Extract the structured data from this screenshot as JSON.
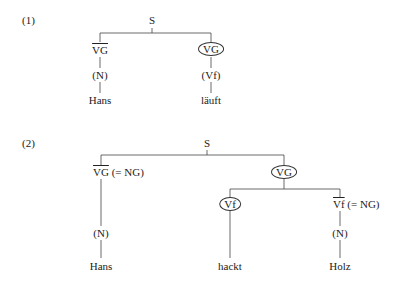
{
  "examples": [
    {
      "number": "(1)",
      "root": "S",
      "left_branch": {
        "node_bar": "VG",
        "node_rest": "",
        "child": "(N)",
        "leaf": "Hans"
      },
      "right_branch": {
        "node": "VG",
        "circled": true,
        "child": "(Vf)",
        "leaf": "läuft"
      }
    },
    {
      "number": "(2)",
      "root": "S",
      "left_branch": {
        "node_bar": "VG",
        "node_rest": " (= NG)",
        "child": "(N)",
        "leaf": "Hans"
      },
      "right_branch": {
        "node": "VG",
        "circled": true,
        "children": [
          {
            "node": "Vf",
            "circled": true,
            "leaf": "hackt"
          },
          {
            "node_bar": "Vf",
            "node_rest": " (= NG)",
            "child": "(N)",
            "leaf": "Holz"
          }
        ]
      }
    }
  ]
}
